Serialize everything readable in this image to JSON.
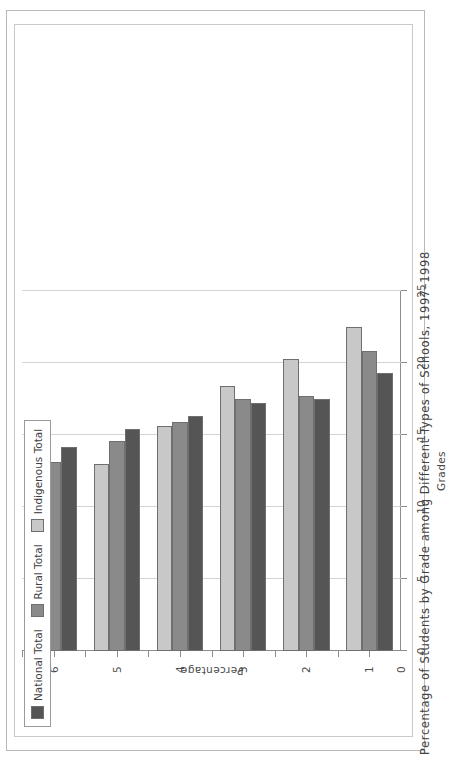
{
  "chart_data": {
    "type": "bar",
    "orientation": "vertical-grouped",
    "title": "Percentage of Students by Grade among Different Types of Schools, 1997–1998",
    "xlabel": "Grades",
    "ylabel": "Percentage",
    "categories": [
      "1",
      "2",
      "3",
      "4",
      "5",
      "6"
    ],
    "ylim": [
      0,
      25
    ],
    "yticks": [
      "0",
      "5",
      "10",
      "15",
      "20",
      "25"
    ],
    "ytick_values": [
      0,
      5,
      10,
      15,
      20,
      25
    ],
    "grid": true,
    "legend_position": "top-left",
    "series": [
      {
        "name": "National Total",
        "color": "#555555",
        "values": [
          19.3,
          17.5,
          17.2,
          16.3,
          15.4,
          14.2
        ]
      },
      {
        "name": "Rural Total",
        "color": "#8a8a8a",
        "values": [
          20.8,
          17.7,
          17.5,
          15.9,
          14.6,
          13.1
        ]
      },
      {
        "name": "Indigenous Total",
        "color": "#c8c8c8",
        "values": [
          22.5,
          20.3,
          18.4,
          15.6,
          13.0,
          10.1
        ]
      }
    ]
  },
  "legend": {
    "items": [
      {
        "label": "National Total",
        "color": "#555555"
      },
      {
        "label": "Rural Total",
        "color": "#8a8a8a"
      },
      {
        "label": "Indigenous Total",
        "color": "#c8c8c8"
      }
    ]
  }
}
